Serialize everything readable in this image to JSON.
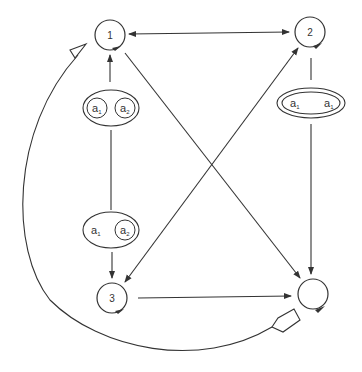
{
  "nodes": [
    {
      "id": "node-1",
      "label": "1",
      "cx": 110,
      "cy": 35,
      "r": 15
    },
    {
      "id": "node-2",
      "label": "2",
      "cx": 310,
      "cy": 32,
      "r": 15
    },
    {
      "id": "node-3",
      "label": "3",
      "cx": 112,
      "cy": 298,
      "r": 15
    },
    {
      "id": "node-4",
      "label": "",
      "cx": 313,
      "cy": 294,
      "r": 15
    }
  ],
  "groups": {
    "top_left": {
      "outer_label": "",
      "items": [
        "a",
        "a"
      ],
      "subs": [
        "1",
        "2"
      ]
    },
    "right": {
      "items": [
        "a",
        "a"
      ],
      "subs": [
        "1",
        "1"
      ]
    },
    "bottom_left": {
      "items": [
        "a",
        "a"
      ],
      "subs": [
        "1",
        "2"
      ]
    }
  },
  "colors": {
    "stroke": "#333333",
    "background": "#ffffff"
  }
}
